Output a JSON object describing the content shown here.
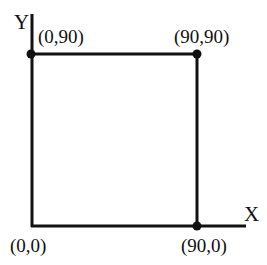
{
  "diagram": {
    "axes": {
      "x_label": "X",
      "y_label": "Y"
    },
    "points": [
      {
        "id": "origin",
        "label": "(0,0)",
        "x": 0,
        "y": 0
      },
      {
        "id": "top-left",
        "label": "(0,90)",
        "x": 0,
        "y": 90
      },
      {
        "id": "top-right",
        "label": "(90,90)",
        "x": 90,
        "y": 90
      },
      {
        "id": "bottom-right",
        "label": "(90,0)",
        "x": 90,
        "y": 0
      }
    ],
    "line_color": "#111111"
  }
}
